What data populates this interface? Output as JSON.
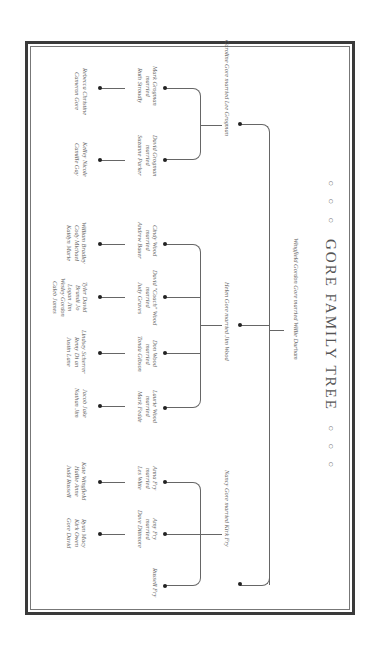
{
  "title": {
    "ornament_left": "○ ○ ○",
    "text": "GORE FAMILY TREE",
    "ornament_right": "○ ○ ○"
  },
  "root": {
    "label": "Wingfield Gordon Gore married Willie Durham"
  },
  "generation2": [
    {
      "label": "Caroline Gore married Lee Grogman"
    },
    {
      "label": "Helen Gore married Jim Wood"
    },
    {
      "label": "Nancy Gore married Kirk Fry"
    }
  ],
  "caroline_children": [
    {
      "name": "Mark Grogman",
      "married": "married",
      "spouse": "Ruth Stroudly",
      "children": [
        "Rebecca Christine",
        "Cameron Gore"
      ]
    },
    {
      "name": "David Grogman",
      "married": "married",
      "spouse": "Suzanne Parker",
      "children": [
        "Kelley Nicole",
        "Camille Gay"
      ]
    }
  ],
  "helen_children": [
    {
      "name": "Cindy Wood",
      "married": "married",
      "spouse": "Andrew Bauer",
      "children": [
        "William Bradley",
        "Cody Michael",
        "Kaitlyn Marie"
      ]
    },
    {
      "name": "David \"Coach\" Wood",
      "married": "married",
      "spouse": "Judy Graves",
      "children": [
        "Tyler David",
        "Brandi Jo",
        "Logan Jim",
        "Wesley Gordon",
        "Caleb James"
      ]
    },
    {
      "name": "Don Wood",
      "married": "married",
      "spouse": "Tonda Gibson",
      "children": [
        "Lindsey Scherrer",
        "Remy Di an",
        "Justin Lane"
      ]
    },
    {
      "name": "Laurie Wood",
      "married": "married",
      "spouse": "Mark Fedde",
      "children": [
        "Jacob Jake",
        "Nathan Jim"
      ]
    }
  ],
  "nancy_children": [
    {
      "name": "Anna Fry",
      "married": "married",
      "spouse": "Les Witte",
      "children": [
        "Kate Wingfield",
        "Hallie Anne",
        "Judd Russell"
      ]
    },
    {
      "name": "Amy Fry",
      "married": "married",
      "spouse": "Dave Dittmore",
      "children": [
        "Ryan Macy",
        "Kirk Owen",
        "Gore David"
      ]
    },
    {
      "name": "Russell Fry",
      "married": "",
      "spouse": "",
      "children": []
    }
  ]
}
